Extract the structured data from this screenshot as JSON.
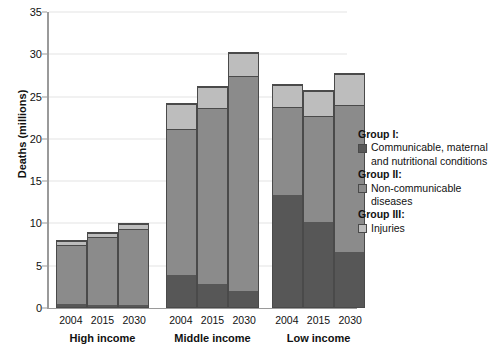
{
  "chart_data": {
    "type": "bar",
    "subtype": "stacked-grouped-bar",
    "title": "",
    "xlabel": "",
    "ylabel": "Deaths (millions)",
    "ylim": [
      0,
      35
    ],
    "yticks": [
      0,
      5,
      10,
      15,
      20,
      25,
      30,
      35
    ],
    "ytick_labels": [
      "0",
      "5",
      "10",
      "15",
      "20",
      "25",
      "30",
      "35"
    ],
    "grid": true,
    "grid_axis": "y",
    "legend_position": "right",
    "groups": [
      "High income",
      "Middle income",
      "Low income"
    ],
    "categories": [
      "2004",
      "2015",
      "2030"
    ],
    "series": [
      {
        "name": "Group I",
        "label": "Communicable, maternal and nutritional conditions",
        "color": "#575757",
        "values": {
          "High income": [
            0.3,
            0.25,
            0.2
          ],
          "Middle income": [
            3.8,
            2.7,
            1.9
          ],
          "Low income": [
            13.3,
            10.0,
            6.5
          ]
        }
      },
      {
        "name": "Group II",
        "label": "Non-communicable diseases",
        "color": "#8b8b8b",
        "values": {
          "High income": [
            7.0,
            8.0,
            9.0
          ],
          "Middle income": [
            17.2,
            20.8,
            25.4
          ],
          "Low income": [
            10.4,
            12.6,
            17.4
          ]
        }
      },
      {
        "name": "Group III",
        "label": "Injuries",
        "color": "#bdbdbd",
        "values": {
          "High income": [
            0.5,
            0.55,
            0.6
          ],
          "Middle income": [
            3.0,
            2.5,
            2.7
          ],
          "Low income": [
            2.5,
            2.9,
            3.6
          ]
        }
      }
    ],
    "totals": {
      "High income": [
        7.8,
        8.8,
        9.8
      ],
      "Middle income": [
        24.0,
        26.0,
        30.0
      ],
      "Low income": [
        26.2,
        25.5,
        27.5
      ]
    }
  },
  "axis": {
    "y_title": "Deaths (millions)",
    "ticks": [
      "35",
      "30",
      "25",
      "20",
      "15",
      "10",
      "5",
      "0"
    ]
  },
  "groups": [
    {
      "name": "High income",
      "label": "High income",
      "years": [
        "2004",
        "2015",
        "2030"
      ]
    },
    {
      "name": "Middle income",
      "label": "Middle income",
      "years": [
        "2004",
        "2015",
        "2030"
      ]
    },
    {
      "name": "Low income",
      "label": "Low income",
      "years": [
        "2004",
        "2015",
        "2030"
      ]
    }
  ],
  "legend": {
    "entries": [
      {
        "head": "Group I:",
        "text": "Communicable, maternal and nutritional conditions",
        "swatch": "group-1-swatch"
      },
      {
        "head": "Group II:",
        "text": "Non-communicable diseases",
        "swatch": "group-2-swatch"
      },
      {
        "head": "Group III:",
        "text": "Injuries",
        "swatch": "group-3-swatch"
      }
    ]
  }
}
